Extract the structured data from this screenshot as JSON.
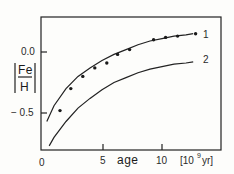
{
  "chart_data": {
    "type": "scatter",
    "title": "",
    "xlabel": "age",
    "x_unit": "[10^9 yr]",
    "x_unit_base": "[10",
    "x_unit_exp": "9",
    "x_unit_tail": "yr]",
    "ylabel": "[Fe/H]",
    "ylabel_num": "Fe",
    "ylabel_den": "H",
    "xlim": [
      0,
      15
    ],
    "ylim": [
      -0.8,
      0.28
    ],
    "x_ticks": [
      {
        "value": 0,
        "label": "0"
      },
      {
        "value": 5,
        "label": "5"
      },
      {
        "value": 10,
        "label": "10"
      }
    ],
    "y_ticks": [
      {
        "value": 0.0,
        "label": "0.0"
      },
      {
        "value": -0.5,
        "label": "− 0.5"
      }
    ],
    "grid": false,
    "legend": "inline curve labels",
    "series": [
      {
        "name": "observed",
        "kind": "points",
        "x": [
          1.5,
          2.4,
          3.4,
          4.4,
          5.4,
          6.3,
          7.3,
          9.3,
          10.3,
          11.3,
          12.8
        ],
        "y": [
          -0.48,
          -0.3,
          -0.2,
          -0.13,
          -0.09,
          -0.02,
          0.02,
          0.1,
          0.12,
          0.13,
          0.15
        ]
      },
      {
        "name": "1",
        "kind": "line",
        "x": [
          0.4,
          1.0,
          2.0,
          3.0,
          4.0,
          5.0,
          6.0,
          7.0,
          8.0,
          9.0,
          10.0,
          11.0,
          12.0,
          12.6
        ],
        "y": [
          -0.57,
          -0.44,
          -0.3,
          -0.2,
          -0.13,
          -0.07,
          -0.02,
          0.02,
          0.06,
          0.09,
          0.11,
          0.13,
          0.14,
          0.15
        ]
      },
      {
        "name": "2",
        "kind": "line",
        "x": [
          0.6,
          1.0,
          2.0,
          3.0,
          4.0,
          5.0,
          6.0,
          7.0,
          8.0,
          9.0,
          10.0,
          11.0,
          12.0,
          12.6
        ],
        "y": [
          -0.77,
          -0.7,
          -0.57,
          -0.46,
          -0.38,
          -0.31,
          -0.25,
          -0.21,
          -0.17,
          -0.14,
          -0.12,
          -0.1,
          -0.09,
          -0.08
        ]
      }
    ]
  },
  "labels": {
    "curve1": "1",
    "curve2": "2",
    "x0": "0",
    "x5": "5",
    "x10": "10",
    "y0": "0.0",
    "ym05": "− 0.5",
    "xlabel": "age",
    "xunit_open": "[10",
    "xunit_exp": "9",
    "xunit_close": "yr]",
    "ynum": "Fe",
    "yden": "H"
  }
}
